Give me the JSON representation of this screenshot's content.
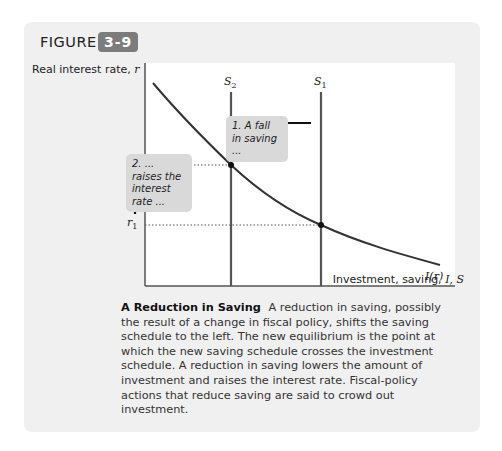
{
  "figure": {
    "label": "FIGURE",
    "number": "3-9",
    "badge_color": "#7c7c7c",
    "box_color": "#f0f0f0"
  },
  "axes": {
    "y_label_text": "Real interest rate, ",
    "y_label_var": "r",
    "x_label_text": "Investment, saving, ",
    "x_label_vars": "I, S"
  },
  "curves": {
    "s2_label": "S",
    "s2_sub": "2",
    "s1_label": "S",
    "s1_sub": "1",
    "investment_label": "I(r)"
  },
  "ticks": {
    "r2_label": "r",
    "r2_sub": "2",
    "r1_label": "r",
    "r1_sub": "1"
  },
  "annotations": {
    "note1": "1. A fall in saving ...",
    "note2": "2. ... raises the interest rate ..."
  },
  "caption": {
    "title": "A Reduction in Saving",
    "body": "A reduction in saving, possibly the result of a change in fiscal policy, shifts the saving schedule to the left. The new equilibrium is the point at which the new saving schedule crosses the investment schedule. A reduction in saving lowers the amount of investment and raises the interest rate. Fiscal-policy actions that reduce saving are said to crowd out investment."
  }
}
